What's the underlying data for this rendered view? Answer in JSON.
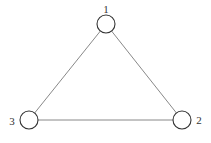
{
  "diagram": {
    "type": "graph",
    "nodes": [
      {
        "id": "1",
        "label": "1",
        "cx": 106,
        "cy": 24,
        "r": 9,
        "lx": 106,
        "ly": 13
      },
      {
        "id": "2",
        "label": "2",
        "cx": 182,
        "cy": 120,
        "r": 9,
        "lx": 199,
        "ly": 124
      },
      {
        "id": "3",
        "label": "3",
        "cx": 29,
        "cy": 120,
        "r": 9,
        "lx": 12,
        "ly": 125
      }
    ],
    "edges": [
      {
        "from": "1",
        "to": "2"
      },
      {
        "from": "1",
        "to": "3"
      },
      {
        "from": "3",
        "to": "2"
      }
    ],
    "colors": {
      "stroke": "#333333",
      "edge": "#6a6a6a",
      "background": "#ffffff"
    }
  }
}
